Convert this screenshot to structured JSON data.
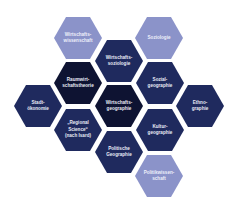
{
  "diagram": {
    "type": "hexagon-cluster",
    "colors": {
      "light": "#8b93c9",
      "dark": "#1f2a5e",
      "darkest": "#0e1332"
    },
    "hexagons": [
      {
        "id": "wirtschaftswissenschaft",
        "lines": [
          "Wirtschafts-",
          "wissenschaft"
        ],
        "shade": "light",
        "cx": 78,
        "cy": 38
      },
      {
        "id": "soziologie",
        "lines": [
          "Soziologie"
        ],
        "shade": "light",
        "cx": 159,
        "cy": 38
      },
      {
        "id": "wirtschaftssoziologie",
        "lines": [
          "Wirtschafts-",
          "soziologie"
        ],
        "shade": "dark",
        "cx": 119,
        "cy": 61
      },
      {
        "id": "raumwirtschaftstheorie",
        "lines": [
          "Raumwirt-",
          "schaftstheorie"
        ],
        "shade": "darkest",
        "cx": 78,
        "cy": 83
      },
      {
        "id": "sozialgeographie",
        "lines": [
          "Sozial-",
          "geographie"
        ],
        "shade": "dark",
        "cx": 160,
        "cy": 83
      },
      {
        "id": "stadtoekonomie",
        "lines": [
          "Stadt-",
          "ökonomie"
        ],
        "shade": "dark",
        "cx": 38,
        "cy": 106
      },
      {
        "id": "wirtschaftsgeographie",
        "lines": [
          "Wirtschafts-",
          "geographie"
        ],
        "shade": "darkest",
        "cx": 119,
        "cy": 106
      },
      {
        "id": "ethnographie",
        "lines": [
          "Ethno-",
          "graphie"
        ],
        "shade": "dark",
        "cx": 200,
        "cy": 106
      },
      {
        "id": "regional-science",
        "lines": [
          "„Regional",
          "Science“",
          "(nach Isard)"
        ],
        "shade": "dark",
        "cx": 78,
        "cy": 130
      },
      {
        "id": "kulturgeographie",
        "lines": [
          "Kultur-",
          "geographie"
        ],
        "shade": "dark",
        "cx": 160,
        "cy": 130
      },
      {
        "id": "politische-geographie",
        "lines": [
          "Politische",
          "Geographie"
        ],
        "shade": "dark",
        "cx": 119,
        "cy": 152
      },
      {
        "id": "politikwissenschaft",
        "lines": [
          "Politikwissen-",
          "schaft"
        ],
        "shade": "light",
        "cx": 159,
        "cy": 176
      }
    ]
  }
}
